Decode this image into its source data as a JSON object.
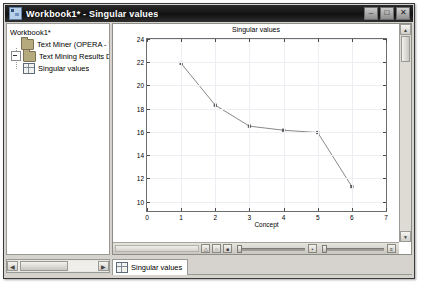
{
  "window": {
    "title": "Workbook1* - Singular values",
    "icon": "workbook-icon",
    "minimize_label": "–",
    "maximize_label": "□",
    "close_label": "✕"
  },
  "tree": {
    "items": [
      {
        "label": "Workbook1*",
        "icon": "none",
        "depth": 0,
        "expander": false
      },
      {
        "label": "Text Miner (OPERA - Wagne",
        "icon": "folder-icon",
        "depth": 1,
        "expander": false
      },
      {
        "label": "Text Mining Results Dial",
        "icon": "folder-icon",
        "depth": 2,
        "expander": true
      },
      {
        "label": "Singular values",
        "icon": "grid-icon",
        "depth": 3,
        "expander": false
      }
    ],
    "scroll_left_arrow": "◀",
    "scroll_right_arrow": "▶"
  },
  "chart_data": {
    "type": "line",
    "title": "Singular values",
    "xlabel": "Concept",
    "ylabel": "Singular value % explained",
    "x": [
      1,
      2,
      3,
      4,
      5,
      6
    ],
    "values": [
      21.9,
      18.3,
      16.5,
      16.15,
      15.95,
      11.3
    ],
    "xlim": [
      0,
      7
    ],
    "ylim": [
      9.2,
      24
    ],
    "xticks": [
      0,
      1,
      2,
      3,
      4,
      5,
      6,
      7
    ],
    "yticks": [
      10,
      12,
      14,
      16,
      18,
      20,
      22,
      24
    ],
    "grid": true,
    "legend": "none",
    "series_color": "#7a7a7a",
    "marker_color": "#5a5a5a"
  },
  "graph_toolbar": {
    "icons": [
      "pan-icon",
      "zoom-out-icon",
      "zoom-window-icon"
    ],
    "slider_left_label": "horizontal-pan-slider",
    "slider_right_label": "horizontal-zoom-slider",
    "end_label": "≡"
  },
  "chart_scroll": {
    "up_arrow": "▲",
    "down_arrow": "▼"
  },
  "tabs": {
    "items": [
      {
        "label": "Singular values",
        "icon": "grid-icon",
        "active": true
      }
    ]
  }
}
